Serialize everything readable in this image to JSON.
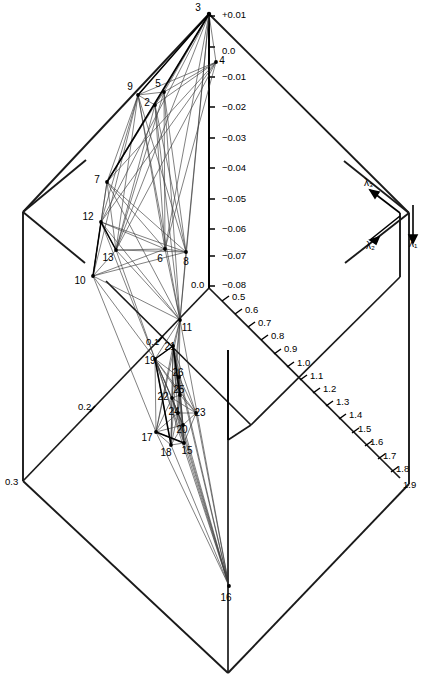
{
  "figure": {
    "title": "",
    "type": "3d-wireframe-projection",
    "background_color": "#ffffff",
    "line_color": "#000000",
    "frame_color": "#1a1a1a"
  },
  "axes": {
    "vertical": {
      "name": "lambda-1-vertical-axis",
      "label": "λ₁",
      "ticks": [
        "+0.01",
        "0.0",
        "−0.01",
        "−0.02",
        "−0.03",
        "−0.04",
        "−0.05",
        "−0.06",
        "−0.07",
        "−0.08"
      ],
      "range": [
        0.01,
        -0.08
      ],
      "top_label": "+0.01",
      "bottom_label": "−0.08"
    },
    "right_diagonal": {
      "name": "lambda-2-axis",
      "label": "λ₂",
      "ticks": [
        "0.0",
        "0.5",
        "0.6",
        "0.7",
        "0.8",
        "0.9",
        "1.0",
        "1.1",
        "1.2",
        "1.3",
        "1.4",
        "1.5",
        "1.6",
        "1.7",
        "1.8",
        "1.9"
      ],
      "range": [
        0.0,
        1.9
      ]
    },
    "left_diagonal": {
      "name": "lambda-3-axis",
      "label": "λ₃",
      "ticks": [
        "0.0",
        "0.1",
        "0.2",
        "0.3"
      ],
      "range": [
        0.0,
        0.3
      ]
    }
  },
  "axis_arrows": [
    {
      "name": "lambda-3-arrow",
      "label": "λ₃",
      "x": 364,
      "y": 186
    },
    {
      "name": "lambda-2-arrow",
      "label": "λ₂",
      "x": 366,
      "y": 249
    },
    {
      "name": "lambda-1-arrow",
      "label": "λ₁",
      "x": 409,
      "y": 247
    }
  ],
  "axis_tick_labels": {
    "vertical": [
      {
        "text": "+0.01",
        "x": 222,
        "y": 14
      },
      {
        "text": "0.0",
        "x": 222,
        "y": 50
      },
      {
        "text": "−0.01",
        "x": 222,
        "y": 76
      },
      {
        "text": "−0.02",
        "x": 222,
        "y": 106
      },
      {
        "text": "−0.03",
        "x": 222,
        "y": 137
      },
      {
        "text": "−0.04",
        "x": 222,
        "y": 167
      },
      {
        "text": "−0.05",
        "x": 222,
        "y": 198
      },
      {
        "text": "−0.06",
        "x": 222,
        "y": 228
      },
      {
        "text": "−0.07",
        "x": 222,
        "y": 255
      },
      {
        "text": "−0.08",
        "x": 222,
        "y": 284
      }
    ],
    "right_diagonal": [
      {
        "text": "0.5",
        "x": 232,
        "y": 296
      },
      {
        "text": "0.6",
        "x": 245,
        "y": 309
      },
      {
        "text": "0.7",
        "x": 258,
        "y": 322
      },
      {
        "text": "0.8",
        "x": 271,
        "y": 335
      },
      {
        "text": "0.9",
        "x": 284,
        "y": 348
      },
      {
        "text": "1.0",
        "x": 297,
        "y": 362
      },
      {
        "text": "1.1",
        "x": 310,
        "y": 375
      },
      {
        "text": "1.2",
        "x": 323,
        "y": 388
      },
      {
        "text": "1.3",
        "x": 336,
        "y": 401
      },
      {
        "text": "1.4",
        "x": 349,
        "y": 414
      },
      {
        "text": "1.5",
        "x": 358,
        "y": 428
      },
      {
        "text": "1.6",
        "x": 370,
        "y": 441
      },
      {
        "text": "1.7",
        "x": 383,
        "y": 455
      },
      {
        "text": "1.8",
        "x": 396,
        "y": 468
      },
      {
        "text": "1.9",
        "x": 403,
        "y": 484
      }
    ],
    "left_diagonal": [
      {
        "text": "0.0",
        "x": 191,
        "y": 284
      },
      {
        "text": "0.1",
        "x": 146,
        "y": 341
      },
      {
        "text": "0.2",
        "x": 78,
        "y": 406
      },
      {
        "text": "0.3",
        "x": 5,
        "y": 481
      }
    ]
  },
  "data_points": [
    {
      "id": "2",
      "label": "2",
      "x": 155,
      "y": 105,
      "lx": 147,
      "ly": 106
    },
    {
      "id": "3",
      "label": "3",
      "x": 209,
      "y": 14,
      "lx": 198,
      "ly": 11
    },
    {
      "id": "4",
      "label": "4",
      "x": 216,
      "y": 62,
      "lx": 222,
      "ly": 64
    },
    {
      "id": "5",
      "label": "5",
      "x": 164,
      "y": 92,
      "lx": 158,
      "ly": 87
    },
    {
      "id": "6",
      "label": "6",
      "x": 165,
      "y": 249,
      "lx": 160,
      "ly": 262
    },
    {
      "id": "7",
      "label": "7",
      "x": 107,
      "y": 182,
      "lx": 97,
      "ly": 183
    },
    {
      "id": "8",
      "label": "8",
      "x": 186,
      "y": 252,
      "lx": 186,
      "ly": 265
    },
    {
      "id": "9",
      "label": "9",
      "x": 138,
      "y": 95,
      "lx": 130,
      "ly": 90
    },
    {
      "id": "10",
      "label": "10",
      "x": 93,
      "y": 276,
      "lx": 80,
      "ly": 284
    },
    {
      "id": "11",
      "label": "11",
      "x": 180,
      "y": 320,
      "lx": 187,
      "ly": 331
    },
    {
      "id": "12",
      "label": "12",
      "x": 101,
      "y": 222,
      "lx": 88,
      "ly": 220
    },
    {
      "id": "13",
      "label": "13",
      "x": 116,
      "y": 250,
      "lx": 108,
      "ly": 261
    },
    {
      "id": "15",
      "label": "15",
      "x": 184,
      "y": 443,
      "lx": 187,
      "ly": 454
    },
    {
      "id": "16",
      "label": "16",
      "x": 229,
      "y": 586,
      "lx": 226,
      "ly": 601
    },
    {
      "id": "17",
      "label": "17",
      "x": 156,
      "y": 432,
      "lx": 147,
      "ly": 441
    },
    {
      "id": "18",
      "label": "18",
      "x": 171,
      "y": 445,
      "lx": 166,
      "ly": 456
    },
    {
      "id": "19",
      "label": "19",
      "x": 155,
      "y": 359,
      "lx": 150,
      "ly": 364
    },
    {
      "id": "20",
      "label": "20",
      "x": 183,
      "y": 425,
      "lx": 182,
      "ly": 433
    },
    {
      "id": "21",
      "label": "21",
      "x": 173,
      "y": 346,
      "lx": 170,
      "ly": 350
    },
    {
      "id": "22",
      "label": "22",
      "x": 172,
      "y": 398,
      "lx": 163,
      "ly": 400
    },
    {
      "id": "23",
      "label": "23",
      "x": 196,
      "y": 413,
      "lx": 200,
      "ly": 416
    },
    {
      "id": "24",
      "label": "24",
      "x": 178,
      "y": 413,
      "lx": 174,
      "ly": 415
    },
    {
      "id": "25",
      "label": "25",
      "x": 180,
      "y": 395,
      "lx": 179,
      "ly": 393
    },
    {
      "id": "26",
      "label": "26",
      "x": 179,
      "y": 377,
      "lx": 178,
      "ly": 376
    }
  ],
  "point_label_texts": [
    "2",
    "3",
    "4",
    "5",
    "6",
    "7",
    "8",
    "9",
    "10",
    "11",
    "12",
    "13",
    "15",
    "16",
    "17",
    "18",
    "19",
    "20",
    "21",
    "22",
    "23",
    "24",
    "25",
    "26"
  ]
}
